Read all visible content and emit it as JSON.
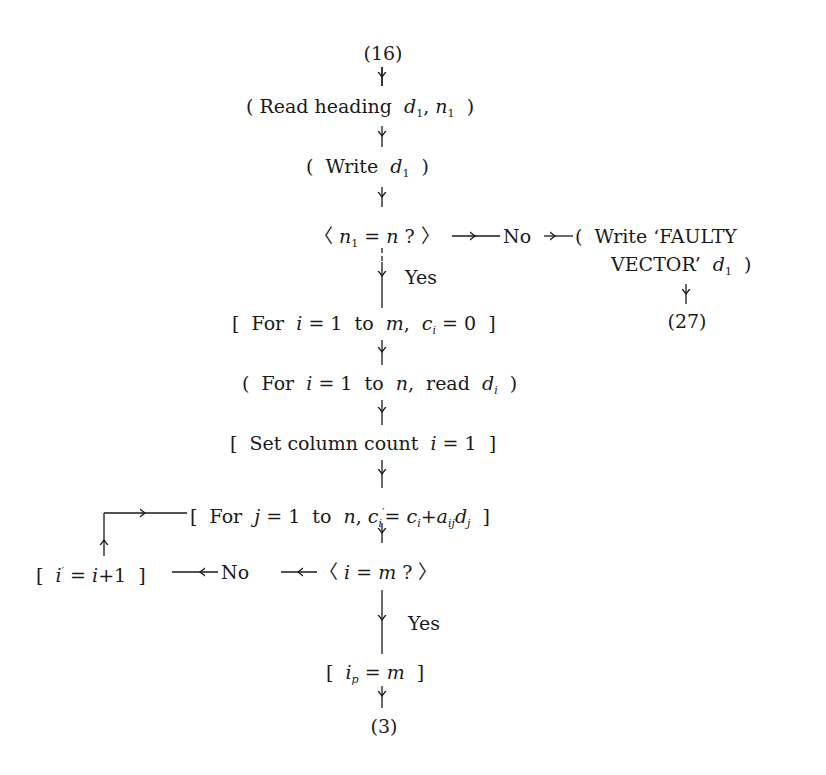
{
  "connectors": {
    "entry": "(16)",
    "exit_main": "(3)",
    "exit_faulty": "(27)"
  },
  "nodes": {
    "read_heading": {
      "shape": "round",
      "prefix": "Read heading",
      "vars": "d1, n1"
    },
    "write_d1": {
      "shape": "round",
      "prefix": "Write",
      "vars": "d1"
    },
    "check_n": {
      "shape": "decision",
      "text": "n1 = n?"
    },
    "write_faulty": {
      "shape": "round",
      "line1": "Write ‘FAULTY",
      "line2": "VECTOR’",
      "vars": "d1"
    },
    "init_c": {
      "shape": "box",
      "prefix": "For",
      "text": "i = 1 to m, ci = 0"
    },
    "read_d": {
      "shape": "round",
      "prefix": "For",
      "text": "i = 1 to n, read di"
    },
    "set_col": {
      "shape": "box",
      "prefix": "Set column count",
      "text": "i = 1"
    },
    "accumulate": {
      "shape": "box",
      "prefix": "For",
      "text": "j = 1 to n, c'i = ci + aij dj"
    },
    "check_m": {
      "shape": "decision",
      "text": "i = m?"
    },
    "increment": {
      "shape": "box",
      "text": "i' = i + 1"
    },
    "set_ip": {
      "shape": "box",
      "text": "ip = m"
    }
  },
  "edge_labels": {
    "check_n_no": "No",
    "check_n_yes": "Yes",
    "check_m_no": "No",
    "check_m_yes": "Yes"
  },
  "text": {
    "read_prefix": "Read heading",
    "write_prefix": "Write",
    "for": "For",
    "to": "to",
    "read": "read",
    "set_col": "Set column count",
    "faulty1": "Write ‘FAULTY",
    "faulty2": "VECTOR’"
  },
  "colors": {
    "ink": "#1a1a1a",
    "background": "#ffffff"
  }
}
